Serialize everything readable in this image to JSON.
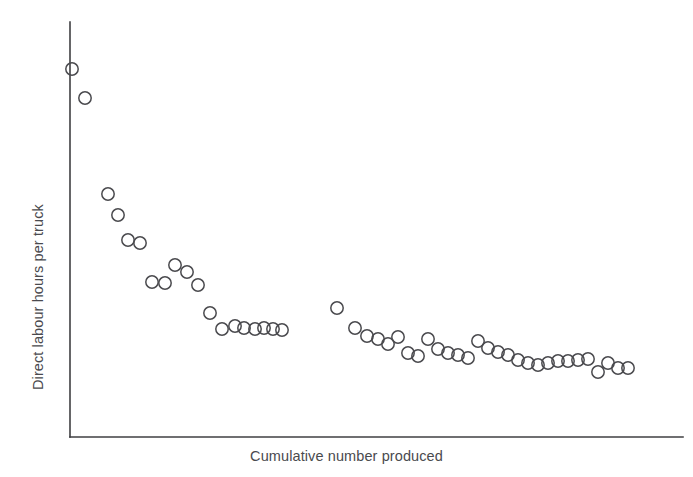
{
  "figure": {
    "name": "learning-curve-scatter",
    "background_color": "#ffffff",
    "marker_color": "#4a4a4e",
    "axis_color": "#3f3f42"
  },
  "axes": {
    "x_label": "Cumulative number produced",
    "y_label": "Direct labour hours per truck",
    "x_axis_start_px": 70,
    "x_axis_end_px": 683,
    "y_axis_top_px": 22,
    "y_axis_bottom_px": 437
  },
  "chart_data": {
    "type": "scatter",
    "title": "",
    "xlabel": "Cumulative number produced",
    "ylabel": "Direct labour hours per truck",
    "grid": false,
    "legend": null,
    "xlim": [
      0,
      100
    ],
    "ylim": [
      0,
      100
    ],
    "x_tick_labels": [],
    "y_tick_labels": [],
    "series": [
      {
        "name": "Batch 1 (early production)",
        "x": [
          0.3,
          2.5,
          6.2,
          7.9,
          9.5,
          11.4,
          13.4,
          15.1,
          17.1,
          19.0,
          20.5,
          22.4,
          24.2,
          26.2,
          27.6,
          29.4,
          31.1,
          32.5,
          33.9
        ],
        "y": [
          88.5,
          81.7,
          58.6,
          53.5,
          47.5,
          46.8,
          37.3,
          37.1,
          41.9,
          40.2,
          37.1,
          30.4,
          26.7,
          27.4,
          26.9,
          26.7,
          26.9,
          26.7,
          26.5
        ]
      },
      {
        "name": "Batch 2 (later production)",
        "x": [
          43.3,
          46.3,
          48.3,
          50.0,
          51.6,
          53.2,
          54.8,
          56.4,
          58.1,
          59.7,
          61.3,
          62.9,
          64.5,
          66.1,
          67.8,
          69.4,
          71.0,
          72.6,
          74.2,
          75.8,
          77.4,
          79.0,
          80.7,
          82.3,
          83.9,
          85.5,
          87.1,
          88.7,
          90.3,
          91.9
        ],
        "y": [
          29.6,
          24.9,
          23.1,
          22.4,
          21.2,
          22.9,
          18.9,
          18.2,
          22.4,
          19.9,
          18.9,
          18.4,
          17.7,
          21.7,
          20.0,
          19.0,
          18.2,
          17.2,
          16.4,
          15.9,
          16.6,
          16.4,
          16.4,
          16.4,
          16.6,
          17.0,
          13.9,
          16.1,
          15.6,
          15.4
        ]
      }
    ],
    "points_px": [
      [
        72,
        69
      ],
      [
        85,
        98
      ],
      [
        108,
        194
      ],
      [
        118,
        215
      ],
      [
        128,
        240
      ],
      [
        140,
        243
      ],
      [
        152,
        282
      ],
      [
        165,
        283
      ],
      [
        175,
        265
      ],
      [
        187,
        272
      ],
      [
        198,
        285
      ],
      [
        210,
        313
      ],
      [
        222,
        329
      ],
      [
        235,
        326
      ],
      [
        244,
        328
      ],
      [
        255,
        329
      ],
      [
        264,
        328
      ],
      [
        273,
        329
      ],
      [
        282,
        330
      ],
      [
        337,
        308
      ],
      [
        355,
        328
      ],
      [
        367,
        336
      ],
      [
        378,
        339
      ],
      [
        388,
        344
      ],
      [
        398,
        337
      ],
      [
        408,
        353
      ],
      [
        418,
        356
      ],
      [
        428,
        339
      ],
      [
        438,
        349
      ],
      [
        448,
        353
      ],
      [
        458,
        355
      ],
      [
        468,
        358
      ],
      [
        478,
        341
      ],
      [
        488,
        348
      ],
      [
        498,
        352
      ],
      [
        508,
        355
      ],
      [
        518,
        360
      ],
      [
        528,
        363
      ],
      [
        538,
        365
      ],
      [
        548,
        363
      ],
      [
        558,
        361
      ],
      [
        568,
        361
      ],
      [
        578,
        360
      ],
      [
        588,
        359
      ],
      [
        598,
        372
      ],
      [
        608,
        363
      ],
      [
        618,
        368
      ],
      [
        628,
        368
      ]
    ],
    "marker_style": {
      "shape": "open-circle",
      "radius_px": 6.2,
      "fill": "none",
      "stroke": "#4a4a4e",
      "stroke_width": 1.5
    }
  }
}
